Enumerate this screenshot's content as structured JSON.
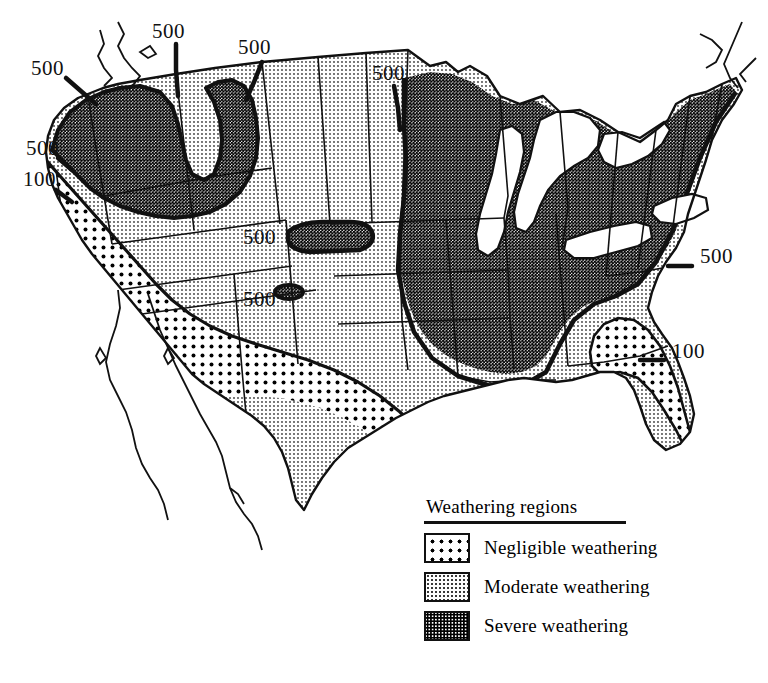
{
  "figure": {
    "kind": "thematic-map",
    "region": "United States",
    "background_color": "#ffffff",
    "line_color": "#111111"
  },
  "legend": {
    "title": "Weathering regions",
    "items": [
      {
        "label": "Negligible weathering",
        "pattern": "large-sparse-dots",
        "swatch_class": "sw-negligible"
      },
      {
        "label": "Moderate weathering",
        "pattern": "fine-light-stipple",
        "swatch_class": "sw-moderate"
      },
      {
        "label": "Severe weathering",
        "pattern": "dense-dark-stipple",
        "swatch_class": "sw-severe"
      }
    ]
  },
  "contour_labels": [
    {
      "id": "nw-coast-500",
      "text": "500",
      "x": 31,
      "y": 75,
      "leader": true
    },
    {
      "id": "north-idaho-500",
      "text": "500",
      "x": 152,
      "y": 38,
      "leader": true
    },
    {
      "id": "north-montana-500",
      "text": "500",
      "x": 238,
      "y": 54,
      "leader": true
    },
    {
      "id": "north-dakota-500",
      "text": "500",
      "x": 372,
      "y": 80,
      "leader": true
    },
    {
      "id": "ca-north-500",
      "text": "500",
      "x": 26,
      "y": 155,
      "leader": true
    },
    {
      "id": "ca-north-100",
      "text": "100",
      "x": 23,
      "y": 186,
      "leader": true
    },
    {
      "id": "blackhills-500",
      "text": "500",
      "x": 243,
      "y": 244,
      "leader": false
    },
    {
      "id": "highplains-500",
      "text": "500",
      "x": 243,
      "y": 306,
      "leader": false
    },
    {
      "id": "mid-atlantic-500",
      "text": "500",
      "x": 700,
      "y": 263,
      "leader": true
    },
    {
      "id": "southeast-100",
      "text": "100",
      "x": 672,
      "y": 358,
      "leader": true
    }
  ]
}
